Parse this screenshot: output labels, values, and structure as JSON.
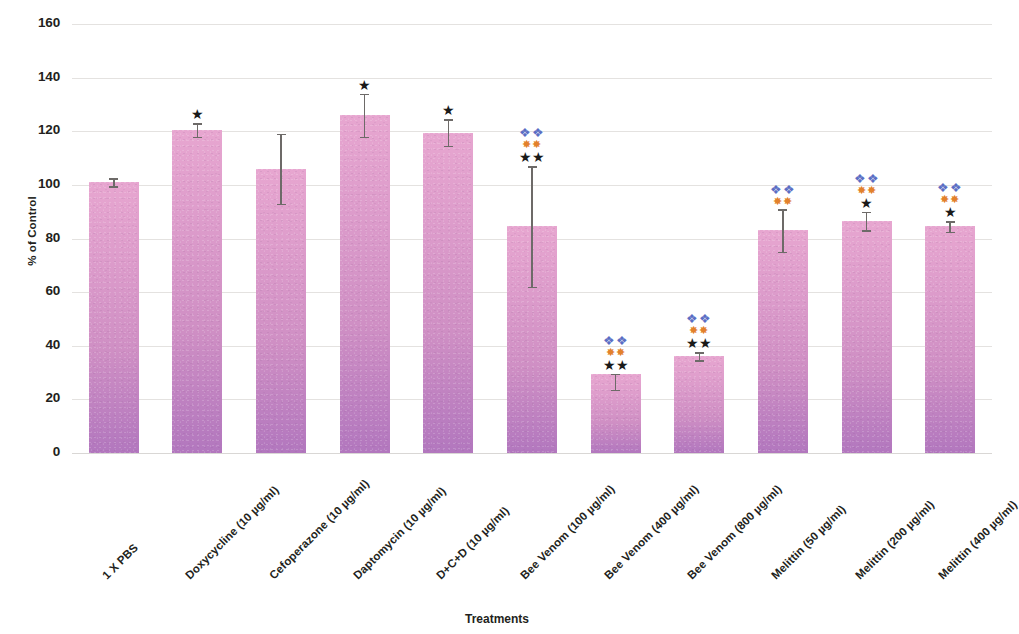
{
  "chart_data": {
    "type": "bar",
    "title": "",
    "xlabel": "Treatments",
    "ylabel": "% of Control",
    "ylim": [
      0,
      160
    ],
    "ytick_step": 20,
    "yticks": [
      160,
      140,
      120,
      100,
      80,
      60,
      40,
      20,
      0
    ],
    "grid": true,
    "legend": "none",
    "bar_color": "#d08fc5",
    "bar_color_top": "#e7a6d0",
    "bar_color_bottom": "#b277be",
    "error_bar_color": "#6d6a68",
    "significance_colors": {
      "blue_marker": "#5b6ec4",
      "orange_marker": "#e2812c",
      "black_star": "#1a1a1a"
    },
    "categories": [
      "1 X PBS",
      "Doxycycline (10 µg/ml)",
      "Cefoperazone (10 µg/ml)",
      "Daptomycin (10 µg/ml)",
      "D+C+D (10 µg/ml)",
      "Bee Venom (100 µg/ml)",
      "Bee Venom (400 µg/ml)",
      "Bee Venom (800 µg/ml)",
      "Melittin (50 µg/ml)",
      "Melittin (200 µg/ml)",
      "Melittin (400 µg/ml)"
    ],
    "values": [
      101,
      120.5,
      106,
      126,
      119.5,
      84.5,
      29.5,
      36,
      83,
      86.5,
      84.5
    ],
    "errors_upper": [
      1.5,
      2.5,
      13,
      8,
      5,
      22.5,
      0,
      1.5,
      8,
      3.5,
      2
    ],
    "errors_lower": [
      1.5,
      2.5,
      13,
      8,
      5,
      22.5,
      6,
      1.5,
      8,
      3.5,
      2
    ],
    "significance": [
      {
        "blue": 0,
        "orange": 0,
        "black": 0
      },
      {
        "blue": 0,
        "orange": 0,
        "black": 1
      },
      {
        "blue": 0,
        "orange": 0,
        "black": 0
      },
      {
        "blue": 0,
        "orange": 0,
        "black": 1
      },
      {
        "blue": 0,
        "orange": 0,
        "black": 1
      },
      {
        "blue": 2,
        "orange": 2,
        "black": 2
      },
      {
        "blue": 2,
        "orange": 2,
        "black": 2
      },
      {
        "blue": 2,
        "orange": 2,
        "black": 2
      },
      {
        "blue": 2,
        "orange": 2,
        "black": 0
      },
      {
        "blue": 2,
        "orange": 2,
        "black": 1
      },
      {
        "blue": 2,
        "orange": 2,
        "black": 1
      }
    ],
    "marker_glyphs": {
      "blue": "❖",
      "orange": "✸",
      "black": "★"
    }
  }
}
